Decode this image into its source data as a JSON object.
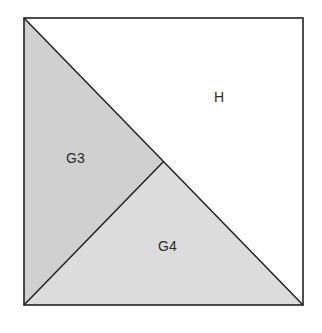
{
  "diagram": {
    "regions": [
      {
        "id": "H",
        "label": "H",
        "fill": "#ffffff"
      },
      {
        "id": "G3",
        "label": "G3",
        "fill": "#d0d0d0"
      },
      {
        "id": "G4",
        "label": "G4",
        "fill": "#dcdcdc"
      }
    ],
    "stroke_color": "#222222"
  }
}
